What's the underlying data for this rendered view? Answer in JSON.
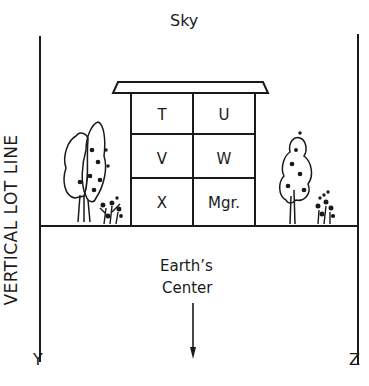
{
  "diagram": {
    "top_label": "Sky",
    "bottom_label_line1": "Earth’s",
    "bottom_label_line2": "Center",
    "left_axis_label": "VERTICAL LOT LINE",
    "left_corner_label": "Y",
    "right_corner_label": "Z",
    "building": {
      "rooms": [
        {
          "label": "T"
        },
        {
          "label": "U"
        },
        {
          "label": "V"
        },
        {
          "label": "W"
        },
        {
          "label": "X"
        },
        {
          "label": "Mgr."
        }
      ]
    },
    "icons": [
      "tree-left-icon",
      "shrub-left-icon",
      "tree-right-icon",
      "shrub-right-icon",
      "down-arrow-icon"
    ],
    "colors": {
      "line": "#1a1a1a",
      "background": "#ffffff"
    }
  }
}
